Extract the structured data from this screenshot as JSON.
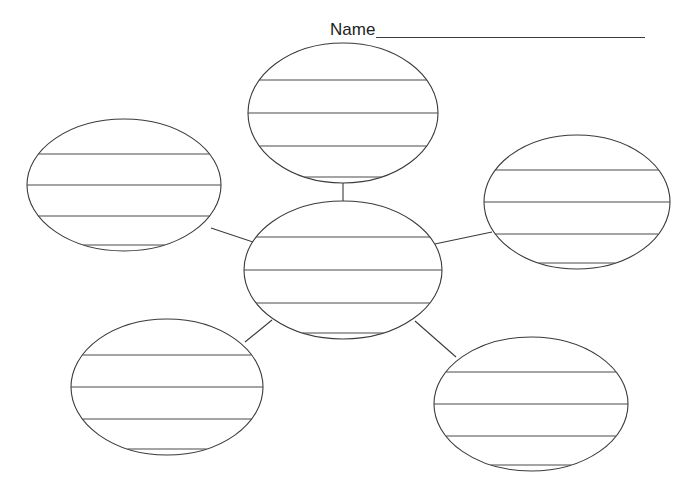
{
  "page": {
    "width": 696,
    "height": 503,
    "background_color": "#ffffff"
  },
  "name_field": {
    "label": "Name",
    "value": "",
    "placeholder": "",
    "blank_line": "________________________________"
  },
  "diagram": {
    "type": "web-cluster-organizer",
    "stroke_color": "#3a3a3a",
    "rule_color": "#4a4a4a",
    "fill_color": "#ffffff",
    "center_node_id": "center",
    "rules_per_node": 4,
    "nodes": [
      {
        "id": "center",
        "name": "center-bubble",
        "label": "",
        "cx": 343,
        "cy": 270,
        "rx": 99,
        "ry": 69,
        "rule_offsets": [
          -33,
          0,
          33,
          63
        ]
      },
      {
        "id": "top",
        "name": "top-bubble",
        "label": "",
        "cx": 343,
        "cy": 113,
        "rx": 95,
        "ry": 70,
        "rule_offsets": [
          -33,
          0,
          33,
          64
        ]
      },
      {
        "id": "left",
        "name": "left-bubble",
        "label": "",
        "cx": 124,
        "cy": 185,
        "rx": 97,
        "ry": 66,
        "rule_offsets": [
          -31,
          0,
          31,
          60
        ]
      },
      {
        "id": "right",
        "name": "right-bubble",
        "label": "",
        "cx": 577,
        "cy": 202,
        "rx": 93,
        "ry": 67,
        "rule_offsets": [
          -32,
          0,
          32,
          61
        ]
      },
      {
        "id": "bottom-left",
        "name": "bottom-left-bubble",
        "label": "",
        "cx": 167,
        "cy": 387,
        "rx": 96,
        "ry": 68,
        "rule_offsets": [
          -32,
          0,
          32,
          62
        ]
      },
      {
        "id": "bottom-right",
        "name": "bottom-right-bubble",
        "label": "",
        "cx": 531,
        "cy": 404,
        "rx": 97,
        "ry": 67,
        "rule_offsets": [
          -32,
          0,
          32,
          61
        ]
      }
    ],
    "connectors": [
      {
        "id": "c-top",
        "name": "connector-center-to-top",
        "x1": 343,
        "y1": 210,
        "x2": 343,
        "y2": 183
      },
      {
        "id": "c-left",
        "name": "connector-center-to-left",
        "x1": 256,
        "y1": 243,
        "x2": 211,
        "y2": 228
      },
      {
        "id": "c-right",
        "name": "connector-center-to-right",
        "x1": 430,
        "y1": 245,
        "x2": 492,
        "y2": 232
      },
      {
        "id": "c-bottom-left",
        "name": "connector-center-to-bottom-left",
        "x1": 272,
        "y1": 320,
        "x2": 245,
        "y2": 342
      },
      {
        "id": "c-bottom-right",
        "name": "connector-center-to-bottom-right",
        "x1": 415,
        "y1": 321,
        "x2": 456,
        "y2": 357
      }
    ]
  }
}
